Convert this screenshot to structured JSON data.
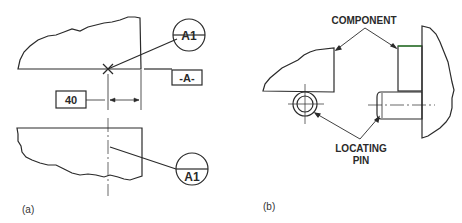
{
  "figure_a": {
    "caption": "(a)",
    "datum_target_top": "A1",
    "datum_target_bottom": "A1",
    "datum_feature": "-A-",
    "dimension": "40"
  },
  "figure_b": {
    "caption": "(b)",
    "label_component": "COMPONENT",
    "label_locating_line1": "LOCATING",
    "label_locating_line2": "PIN"
  },
  "colors": {
    "line": "#2a2a2a",
    "background": "#ffffff",
    "accent_green": "#2e8b2e"
  }
}
